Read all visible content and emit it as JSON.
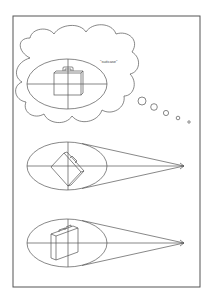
{
  "figure": {
    "colors": {
      "stroke": "#555555",
      "background": "#ffffff",
      "text": "#444444"
    },
    "thought_bubble": {
      "label": "\"suitcase\"",
      "trail_bubbles": 5
    },
    "panels": [
      {
        "id": "imagined",
        "suitcase_orientation": "upright-front"
      },
      {
        "id": "view-rotated",
        "suitcase_orientation": "tilted-45"
      },
      {
        "id": "view-angled",
        "suitcase_orientation": "side-angled"
      }
    ],
    "icons": [
      "suitcase-icon",
      "arrow-icon",
      "crosshair-icon",
      "thought-cloud-icon"
    ]
  }
}
